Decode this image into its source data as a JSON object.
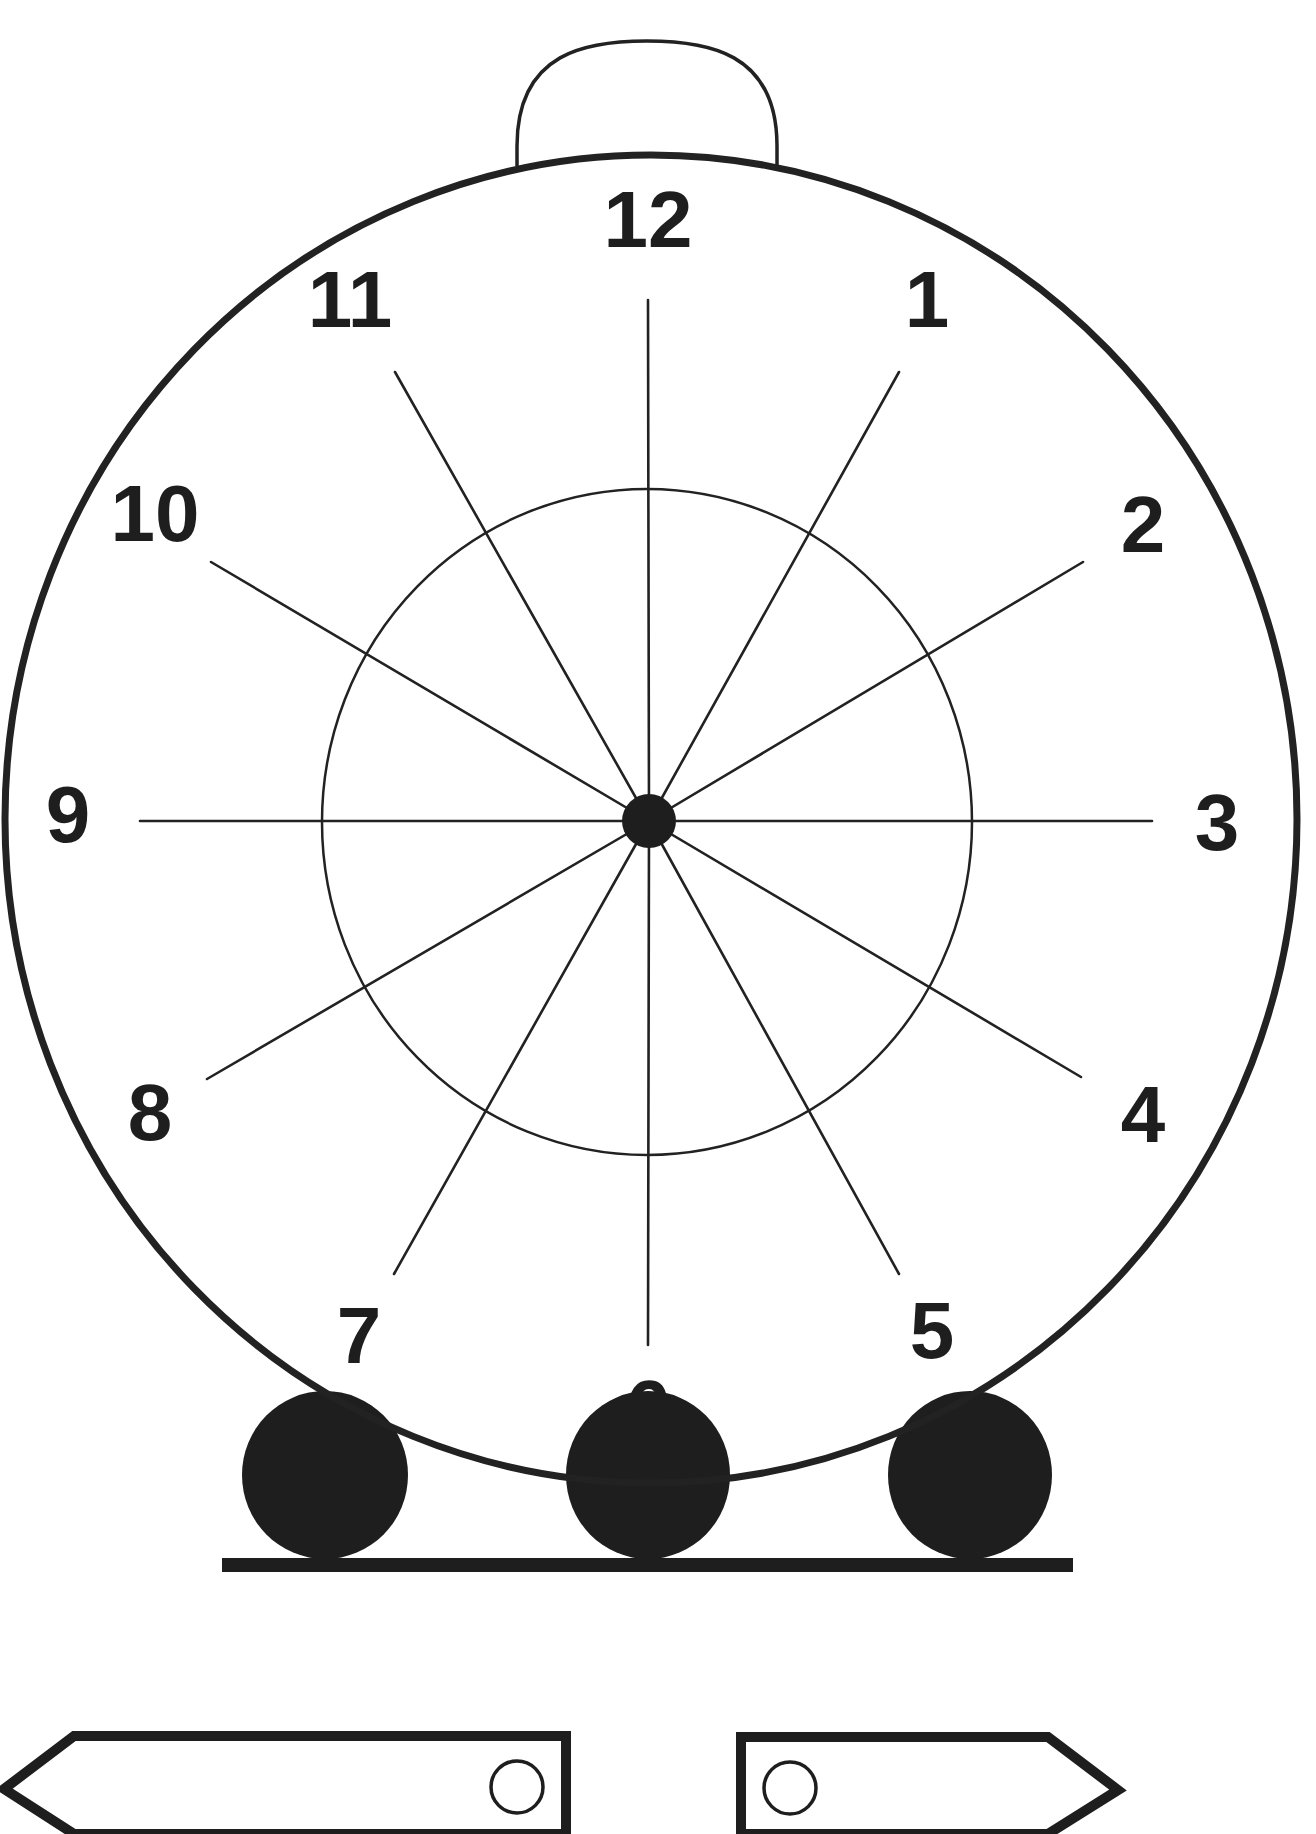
{
  "colors": {
    "ink": "#1e1e1e",
    "paper": "#ffffff"
  },
  "clock": {
    "hour_numbers": [
      {
        "label": "12",
        "x": 648,
        "y": 219
      },
      {
        "label": "1",
        "x": 927,
        "y": 299
      },
      {
        "label": "2",
        "x": 1143,
        "y": 524
      },
      {
        "label": "3",
        "x": 1217,
        "y": 822
      },
      {
        "label": "4",
        "x": 1143,
        "y": 1114
      },
      {
        "label": "5",
        "x": 932,
        "y": 1330
      },
      {
        "label": "6",
        "x": 648,
        "y": 1408
      },
      {
        "label": "7",
        "x": 359,
        "y": 1335
      },
      {
        "label": "8",
        "x": 150,
        "y": 1112
      },
      {
        "label": "9",
        "x": 68,
        "y": 814
      },
      {
        "label": "10",
        "x": 155,
        "y": 513
      },
      {
        "label": "11",
        "x": 350,
        "y": 299
      }
    ],
    "spoke_ends": [
      {
        "hour": "12",
        "x": 648,
        "y": 300
      },
      {
        "hour": "1",
        "x": 899,
        "y": 372
      },
      {
        "hour": "2",
        "x": 1083,
        "y": 562
      },
      {
        "hour": "3",
        "x": 1152,
        "y": 821
      },
      {
        "hour": "4",
        "x": 1081,
        "y": 1077
      },
      {
        "hour": "5",
        "x": 899,
        "y": 1274
      },
      {
        "hour": "6",
        "x": 648,
        "y": 1345
      },
      {
        "hour": "7",
        "x": 394,
        "y": 1274
      },
      {
        "hour": "8",
        "x": 207,
        "y": 1079
      },
      {
        "hour": "9",
        "x": 140,
        "y": 821
      },
      {
        "hour": "10",
        "x": 211,
        "y": 562
      },
      {
        "hour": "11",
        "x": 395,
        "y": 372
      }
    ],
    "center": {
      "x": 649,
      "y": 821,
      "r": 27
    },
    "inner_ring": {
      "cx": 647,
      "cy": 822,
      "rx": 325,
      "ry": 333
    },
    "outer_face": {
      "cx": 651,
      "cy": 819,
      "rx": 646,
      "ry": 664
    },
    "top_bell": {
      "cx": 647,
      "rx": 130,
      "top": 41,
      "base": 166
    }
  },
  "stand": {
    "feet": [
      {
        "name": "left",
        "cx": 325,
        "cy": 1475,
        "rx": 83,
        "ry": 84
      },
      {
        "name": "middle",
        "cx": 648,
        "cy": 1475,
        "rx": 82,
        "ry": 84
      },
      {
        "name": "right",
        "cx": 970,
        "cy": 1475,
        "rx": 82,
        "ry": 84
      }
    ],
    "base_bar": {
      "x1": 222,
      "x2": 1073,
      "y": 1558,
      "height": 14
    }
  },
  "hands": [
    {
      "name": "long-hand",
      "direction": "left",
      "points": "4,1789 74,1736 566,1736 566,1834 74,1834",
      "pivot": {
        "cx": 517,
        "cy": 1787,
        "r": 26
      }
    },
    {
      "name": "short-hand",
      "direction": "right",
      "points": "741,1737 1048,1737 1118,1790 1048,1834 741,1834",
      "pivot": {
        "cx": 790,
        "cy": 1788,
        "r": 26
      }
    }
  ]
}
